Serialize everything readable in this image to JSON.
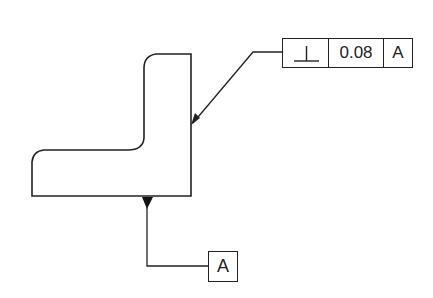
{
  "drawing": {
    "feature_control_frame": {
      "symbol": "perpendicularity",
      "symbol_glyph": "⊥",
      "tolerance": "0.08",
      "datum": "A"
    },
    "datum_feature": {
      "label": "A"
    },
    "colors": {
      "line": "#222222",
      "background": "#ffffff"
    }
  }
}
